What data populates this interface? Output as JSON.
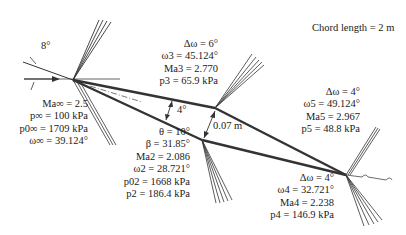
{
  "title": "Chord length = 2 m",
  "freestream": {
    "angle_label": "8°",
    "lines": [
      "Ma∞ = 2.5",
      "p∞ = 100 kPa",
      "p0∞ = 1709 kPa",
      "ω∞ = 39.124°"
    ]
  },
  "region3": {
    "lines": [
      "Δω = 6°",
      "ω3 = 45.124°",
      "Ma3 = 2.770",
      "p3 = 65.9 kPa"
    ]
  },
  "region2": {
    "lines": [
      "θ = 10°",
      "β = 31.85°",
      "Ma2 = 2.086",
      "ω2 = 28.721°",
      "p02 = 1668 kPa",
      "p2 = 186.4 kPa"
    ]
  },
  "region5": {
    "lines": [
      "Δω = 4°",
      "ω5 = 49.124°",
      "Ma5 = 2.967",
      "p5 = 48.8 kPa"
    ]
  },
  "region4": {
    "lines": [
      "Δω = 4°",
      "ω4 = 32.721°",
      "Ma4 = 2.238",
      "p4 = 146.9 kPa"
    ]
  },
  "geometry": {
    "half_angle_label": "4°",
    "thickness_label": "0.07 m"
  }
}
